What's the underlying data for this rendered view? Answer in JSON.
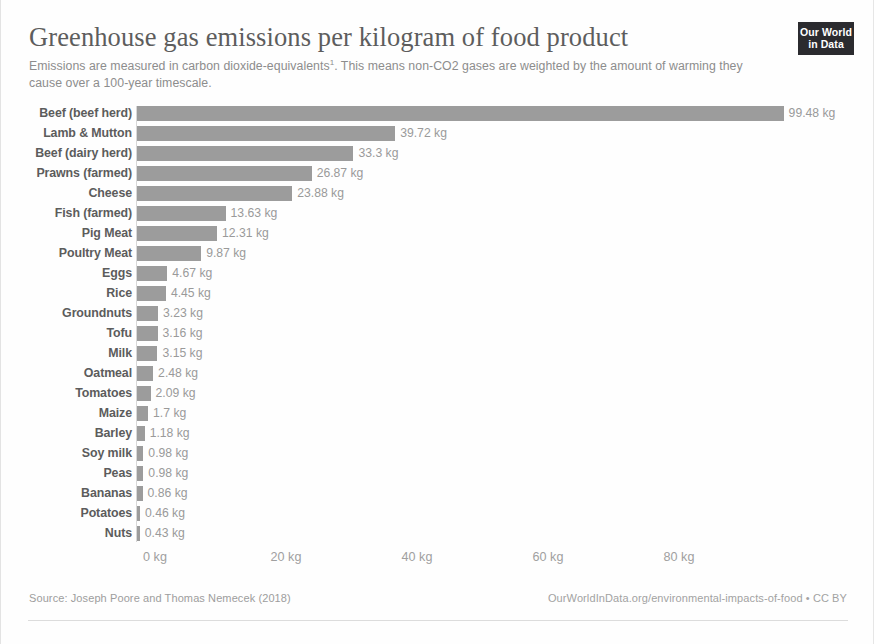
{
  "header": {
    "title": "Greenhouse gas emissions per kilogram of food product",
    "subtitle": "Emissions are measured in carbon dioxide-equivalents. This means non-CO2 gases are weighted by the amount of warming they cause over a 100-year timescale.",
    "subtitle_footnote_marker": "1",
    "logo_line1": "Our World",
    "logo_line2": "in Data"
  },
  "footer": {
    "source": "Source: Joseph Poore and Thomas Nemecek (2018)",
    "link": "OurWorldInData.org/environmental-impacts-of-food • CC BY"
  },
  "colors": {
    "bar": "#9c9c9c",
    "title": "#5d5d5d",
    "subtitle": "#8d8d8d",
    "category_label": "#5c5c5c",
    "value_label": "#9a9a9a",
    "axis_label": "#a0a0a0",
    "logo_background": "#2b2b2f",
    "background": "#ffffff"
  },
  "chart_data": {
    "type": "bar",
    "orientation": "horizontal",
    "title": "Greenhouse gas emissions per kilogram of food product",
    "subtitle": "Emissions are measured in carbon dioxide-equivalents. This means non-CO2 gases are weighted by the amount of warming they cause over a 100-year timescale.",
    "xlabel": "",
    "ylabel": "",
    "unit": "kg",
    "xlim": [
      0,
      99.48
    ],
    "grid": false,
    "legend": false,
    "axis_ticks": [
      "0 kg",
      "20 kg",
      "40 kg",
      "60 kg",
      "80 kg"
    ],
    "axis_tick_values": [
      0,
      20,
      40,
      60,
      80
    ],
    "categories": [
      "Beef (beef herd)",
      "Lamb & Mutton",
      "Beef (dairy herd)",
      "Prawns (farmed)",
      "Cheese",
      "Fish (farmed)",
      "Pig Meat",
      "Poultry Meat",
      "Eggs",
      "Rice",
      "Groundnuts",
      "Tofu",
      "Milk",
      "Oatmeal",
      "Tomatoes",
      "Maize",
      "Barley",
      "Soy milk",
      "Peas",
      "Bananas",
      "Potatoes",
      "Nuts"
    ],
    "values": [
      99.48,
      39.72,
      33.3,
      26.87,
      23.88,
      13.63,
      12.31,
      9.87,
      4.67,
      4.45,
      3.23,
      3.16,
      3.15,
      2.48,
      2.09,
      1.7,
      1.18,
      0.98,
      0.98,
      0.86,
      0.46,
      0.43
    ],
    "value_labels": [
      "99.48 kg",
      "39.72 kg",
      "33.3 kg",
      "26.87 kg",
      "23.88 kg",
      "13.63 kg",
      "12.31 kg",
      "9.87 kg",
      "4.67 kg",
      "4.45 kg",
      "3.23 kg",
      "3.16 kg",
      "3.15 kg",
      "2.48 kg",
      "2.09 kg",
      "1.7 kg",
      "1.18 kg",
      "0.98 kg",
      "0.98 kg",
      "0.86 kg",
      "0.46 kg",
      "0.43 kg"
    ]
  }
}
